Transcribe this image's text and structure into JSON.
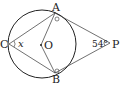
{
  "diagram": {
    "points": {
      "A": "A",
      "B": "B",
      "C": "C",
      "O": "O",
      "P": "P"
    },
    "angle_x": "x",
    "angle_p": "54°"
  },
  "colors": {
    "stroke": "#222222",
    "background": "#ffffff"
  }
}
